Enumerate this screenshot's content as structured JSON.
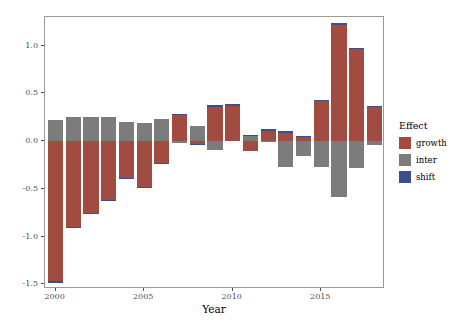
{
  "chart_data": {
    "type": "bar",
    "stacked": true,
    "title": "",
    "xlabel": "Year",
    "ylabel": "Beta contribution",
    "grid": false,
    "legend_position": "right",
    "legend_title": "Effect",
    "xlim": [
      1999.4,
      2018.6
    ],
    "ylim": [
      -1.55,
      1.3
    ],
    "y_ticks": [
      "1.0",
      "0.5",
      "0.0",
      "-0.5",
      "-1.0",
      "-1.5"
    ],
    "y_tick_values": [
      1.0,
      0.5,
      0.0,
      -0.5,
      -1.0,
      -1.5
    ],
    "x_ticks": [
      "2000",
      "2005",
      "2010",
      "2015"
    ],
    "x_tick_values": [
      2000,
      2005,
      2010,
      2015
    ],
    "categories": [
      2000,
      2001,
      2002,
      2003,
      2004,
      2005,
      2006,
      2007,
      2008,
      2009,
      2010,
      2011,
      2012,
      2013,
      2014,
      2015,
      2016,
      2017,
      2018
    ],
    "series": [
      {
        "name": "growth",
        "color": "#A24C41",
        "values": [
          -1.47,
          -0.9,
          -0.75,
          -0.62,
          -0.39,
          -0.48,
          -0.23,
          0.28,
          -0.03,
          0.37,
          0.37,
          -0.1,
          0.12,
          0.1,
          0.05,
          0.43,
          1.23,
          0.97,
          0.37
        ]
      },
      {
        "name": "inter",
        "color": "#7C7C7C",
        "values": [
          0.22,
          0.25,
          0.25,
          0.25,
          0.2,
          0.19,
          0.23,
          -0.02,
          0.16,
          -0.09,
          0.01,
          0.06,
          -0.01,
          -0.27,
          -0.16,
          -0.27,
          -0.59,
          -0.28,
          -0.04
        ]
      },
      {
        "name": "shift",
        "color": "#3B4F8E",
        "values": [
          -0.012,
          -0.012,
          -0.012,
          -0.012,
          -0.012,
          -0.012,
          -0.012,
          0.004,
          -0.008,
          0.004,
          0.004,
          0.002,
          0.002,
          0.002,
          0.002,
          0.002,
          0.002,
          0.002,
          0.002
        ]
      }
    ]
  },
  "legend": {
    "title": "Effect",
    "items": [
      {
        "label": "growth",
        "color": "#A24C41"
      },
      {
        "label": "inter",
        "color": "#7C7C7C"
      },
      {
        "label": "shift",
        "color": "#3B4F8E"
      }
    ]
  },
  "axes": {
    "y_title": "Beta contribution",
    "x_title": "Year"
  }
}
